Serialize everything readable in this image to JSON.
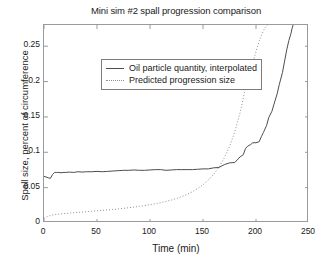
{
  "chart_data": {
    "type": "line",
    "title": "Mini sim #2 spall progression comparison",
    "xlabel": "Time (min)",
    "ylabel": "Spall size, percent of circumference",
    "xlim": [
      0,
      250
    ],
    "ylim": [
      0,
      0.28
    ],
    "grid": false,
    "legend_position": "upper left",
    "xticks": [
      0,
      50,
      100,
      150,
      200,
      250
    ],
    "xtick_labels": [
      "0",
      "50",
      "100",
      "150",
      "200",
      "250"
    ],
    "yticks": [
      0,
      0.05,
      0.1,
      0.15,
      0.2,
      0.25
    ],
    "ytick_labels": [
      "0",
      "0.05",
      "0.1",
      "0.15",
      "0.2",
      "0.25"
    ],
    "series": [
      {
        "name": "Oil particle quantity, interpolated",
        "style": "solid",
        "color": "#4d4d4d",
        "x": [
          0,
          2,
          4,
          6,
          8,
          10,
          12,
          14,
          16,
          18,
          20,
          24,
          28,
          32,
          36,
          40,
          45,
          50,
          55,
          60,
          65,
          70,
          75,
          80,
          85,
          90,
          95,
          100,
          105,
          110,
          115,
          120,
          125,
          130,
          135,
          140,
          145,
          150,
          155,
          160,
          165,
          170,
          175,
          180,
          185,
          188,
          190,
          192,
          195,
          197,
          200,
          203,
          205,
          207,
          210,
          212,
          215,
          217,
          220,
          222,
          225,
          227,
          229,
          231,
          233,
          234,
          235
        ],
        "y": [
          0.066,
          0.065,
          0.064,
          0.063,
          0.0685,
          0.0715,
          0.0715,
          0.0715,
          0.071,
          0.0715,
          0.0715,
          0.072,
          0.0715,
          0.0725,
          0.072,
          0.0725,
          0.0725,
          0.073,
          0.0725,
          0.073,
          0.0735,
          0.074,
          0.0745,
          0.0745,
          0.075,
          0.0745,
          0.0745,
          0.075,
          0.0755,
          0.0755,
          0.0745,
          0.075,
          0.0755,
          0.0755,
          0.0755,
          0.0755,
          0.076,
          0.0765,
          0.0765,
          0.078,
          0.0785,
          0.0825,
          0.085,
          0.0855,
          0.0935,
          0.0965,
          0.105,
          0.1085,
          0.111,
          0.1135,
          0.1135,
          0.115,
          0.122,
          0.128,
          0.138,
          0.149,
          0.158,
          0.168,
          0.183,
          0.196,
          0.213,
          0.229,
          0.245,
          0.258,
          0.268,
          0.275,
          0.28
        ]
      },
      {
        "name": "Predicted progression size",
        "style": "dotted",
        "color": "#8e8e8e",
        "x": [
          0,
          3,
          6,
          10,
          15,
          20,
          25,
          30,
          35,
          40,
          45,
          50,
          55,
          60,
          65,
          70,
          75,
          80,
          85,
          90,
          95,
          100,
          105,
          110,
          115,
          120,
          125,
          130,
          135,
          140,
          145,
          150,
          155,
          160,
          165,
          170,
          175,
          180,
          185,
          190,
          193,
          196,
          199,
          201,
          203,
          205,
          207,
          209,
          210,
          211
        ],
        "y": [
          0.0065,
          0.009,
          0.0105,
          0.0118,
          0.0128,
          0.0135,
          0.0142,
          0.0148,
          0.0154,
          0.016,
          0.0166,
          0.0172,
          0.0178,
          0.0185,
          0.0192,
          0.0199,
          0.0207,
          0.0216,
          0.0225,
          0.0235,
          0.0246,
          0.0258,
          0.0272,
          0.0287,
          0.0304,
          0.0324,
          0.0347,
          0.0374,
          0.0405,
          0.0442,
          0.0487,
          0.0541,
          0.0607,
          0.0688,
          0.0789,
          0.0917,
          0.108,
          0.129,
          0.156,
          0.191,
          0.206,
          0.221,
          0.237,
          0.248,
          0.257,
          0.265,
          0.272,
          0.277,
          0.279,
          0.28
        ]
      }
    ]
  }
}
